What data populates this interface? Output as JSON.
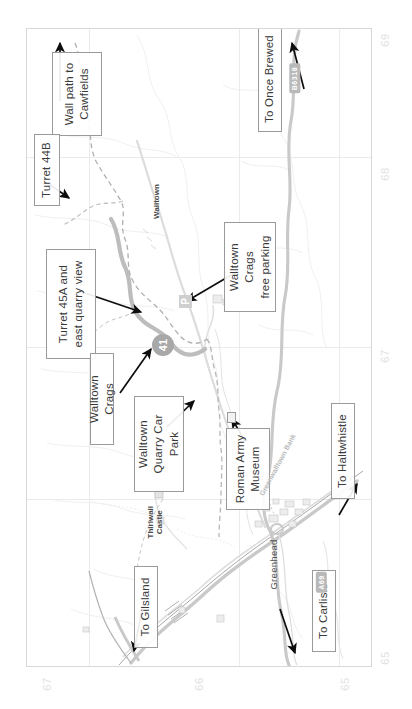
{
  "map": {
    "type": "topographic-walking-map",
    "orientation": "rotated-90-ccw",
    "region": "Walltown Crags / Greenhead, Hadrian's Wall",
    "callouts": [
      {
        "id": "wall-path-cawfields",
        "text": "Wall path to\nCawfields"
      },
      {
        "id": "turret-44b",
        "text": "Turret 44B"
      },
      {
        "id": "to-once-brewed",
        "text": "To Once Brewed"
      },
      {
        "id": "walltown-crags-free-parking",
        "text": "Walltown Crags\nfree parking"
      },
      {
        "id": "turret-45a",
        "text": "Turret 45A and\neast quarry view"
      },
      {
        "id": "walltown-crags",
        "text": "Walltown Crags"
      },
      {
        "id": "walltown-quarry-car-park",
        "text": "Walltown\nQuarry Car Park"
      },
      {
        "id": "roman-army-museum",
        "text": "Roman Army\nMuseum"
      },
      {
        "id": "to-haltwhistle",
        "text": "To Haltwhistle"
      },
      {
        "id": "to-gilsland",
        "text": "To Gilsland"
      },
      {
        "id": "to-carlisle",
        "text": "To Carlisle"
      }
    ],
    "places": [
      {
        "id": "walltown",
        "text": "Walltown"
      },
      {
        "id": "thirlwall-castle",
        "text": "Thirlwall\nCastle"
      },
      {
        "id": "greenhead",
        "text": "Greenhead"
      },
      {
        "id": "greenwalltown-bank",
        "text": "Greenwalltown Bank"
      }
    ],
    "road_badges": [
      {
        "id": "b6318",
        "text": "B6318"
      },
      {
        "id": "a69",
        "text": "A69"
      }
    ],
    "symbols": {
      "parking_letter": "P",
      "trail_marker_number": "41"
    },
    "grid_numbers_right": [
      "69",
      "68",
      "67"
    ],
    "grid_numbers_bottom": [
      "67",
      "66",
      "65"
    ],
    "grid_number_bottom_right": "65",
    "colors": {
      "primary_road": "#c9c9c9",
      "secondary_road": "#d4d4d4",
      "trail_dashed": "#bdbdbd",
      "wall_path": "#b0b0b0",
      "crag_line": "#b5b5b5",
      "grid": "#e9ecef",
      "frame": "#d8d8d8",
      "callout_border": "#9a9a9a",
      "arrow": "#101010",
      "badge_bg": "#b9b9b9"
    }
  }
}
